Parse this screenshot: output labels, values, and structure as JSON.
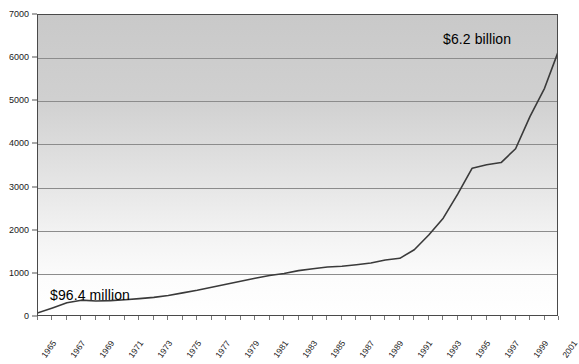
{
  "chart_data": {
    "type": "line",
    "title": "",
    "subtitle": "",
    "xlabel": "",
    "ylabel": "",
    "grid": true,
    "legend": false,
    "legend_position": "none",
    "xlim": [
      1965,
      2001
    ],
    "ylim": [
      0,
      7000
    ],
    "y_ticks": [
      0,
      1000,
      2000,
      3000,
      4000,
      5000,
      6000,
      7000
    ],
    "y_tick_labels": [
      "0",
      "1000",
      "2000",
      "3000",
      "4000",
      "5000",
      "6000",
      "7000"
    ],
    "x_tick_labels": [
      "1965",
      "1967",
      "1969",
      "1971",
      "1973",
      "1975",
      "1977",
      "1979",
      "1981",
      "1983",
      "1985",
      "1987",
      "1989",
      "1991",
      "1993",
      "1995",
      "1997",
      "1999",
      "2001"
    ],
    "x_all_years": [
      1965,
      1966,
      1967,
      1968,
      1969,
      1970,
      1971,
      1972,
      1973,
      1974,
      1975,
      1976,
      1977,
      1978,
      1979,
      1980,
      1981,
      1982,
      1983,
      1984,
      1985,
      1986,
      1987,
      1988,
      1989,
      1990,
      1991,
      1992,
      1993,
      1994,
      1995,
      1996,
      1997,
      1998,
      1999,
      2000,
      2001
    ],
    "series": [
      {
        "name": "Value",
        "color": "#3a3a3a",
        "x": [
          1965,
          1966,
          1967,
          1968,
          1969,
          1970,
          1971,
          1972,
          1973,
          1974,
          1975,
          1976,
          1977,
          1978,
          1979,
          1980,
          1981,
          1982,
          1983,
          1984,
          1985,
          1986,
          1987,
          1988,
          1989,
          1990,
          1991,
          1992,
          1993,
          1994,
          1995,
          1996,
          1997,
          1998,
          1999,
          2000,
          2001
        ],
        "values": [
          96.4,
          210,
          330,
          390,
          370,
          380,
          400,
          425,
          455,
          500,
          560,
          620,
          690,
          760,
          830,
          900,
          960,
          1010,
          1075,
          1120,
          1160,
          1175,
          1210,
          1250,
          1320,
          1360,
          1560,
          1900,
          2290,
          2850,
          3450,
          3530,
          3580,
          3900,
          4650,
          5300,
          6200
        ]
      }
    ],
    "annotations": [
      {
        "name": "high-value",
        "text": "$6.2 billion",
        "x": 1999,
        "y": 6600
      },
      {
        "name": "low-value",
        "text": "$96.4 million",
        "x": 1966,
        "y": 720
      }
    ]
  },
  "annotations": {
    "high": "$6.2 billion",
    "low": "$96.4 million"
  },
  "colors": {
    "line": "#3a3a3a",
    "gridline": "#8c8c8c",
    "frame": "#4a4a4a",
    "background_top": "#c9c9c9",
    "background_bottom": "#ffffff",
    "text": "#1a1a1a"
  }
}
